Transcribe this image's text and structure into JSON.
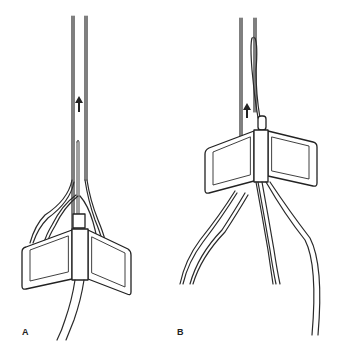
{
  "figure": {
    "panels": [
      {
        "id": "A",
        "label": "A",
        "description": "catheter with winged hub below bifurcation, arrow pointing up"
      },
      {
        "id": "B",
        "label": "B",
        "description": "winged hub advanced up catheter, leads diverging below"
      }
    ],
    "arrow_direction": "up",
    "colors": {
      "stroke": "#2a2a2a",
      "background": "#ffffff"
    }
  }
}
